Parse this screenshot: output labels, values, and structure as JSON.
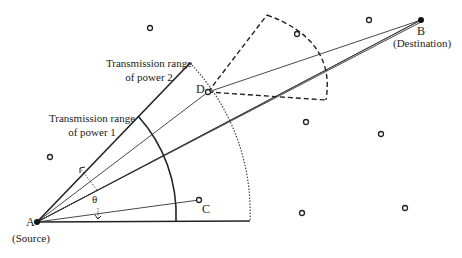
{
  "diagram": {
    "type": "directional-antenna-transmission-range",
    "nodes": [
      {
        "id": "A",
        "label": "A",
        "role": "(Source)",
        "x": 37,
        "y": 222,
        "filled": true
      },
      {
        "id": "B",
        "label": "B",
        "role": "(Destination)",
        "x": 421,
        "y": 20,
        "filled": true
      },
      {
        "id": "C",
        "label": "C",
        "x": 199,
        "y": 200,
        "filled": false
      },
      {
        "id": "D",
        "label": "D",
        "x": 208,
        "y": 92,
        "filled": false
      }
    ],
    "other_nodes": [
      {
        "x": 150,
        "y": 28
      },
      {
        "x": 297,
        "y": 34
      },
      {
        "x": 369,
        "y": 20
      },
      {
        "x": 50,
        "y": 157
      },
      {
        "x": 381,
        "y": 134
      },
      {
        "x": 302,
        "y": 213
      },
      {
        "x": 405,
        "y": 208
      },
      {
        "x": 306,
        "y": 122
      }
    ],
    "labels": {
      "range_power_2_line1": "Transmission range",
      "range_power_2_line2": "of power 2",
      "range_power_1_line1": "Transmission range",
      "range_power_1_line2": "of power 1",
      "angle": "θ",
      "source": "(Source)",
      "destination": "(Destination)",
      "node_a": "A",
      "node_b": "B",
      "node_c": "C",
      "node_d": "D"
    },
    "colors": {
      "stroke": "#222222",
      "background": "#ffffff"
    }
  }
}
